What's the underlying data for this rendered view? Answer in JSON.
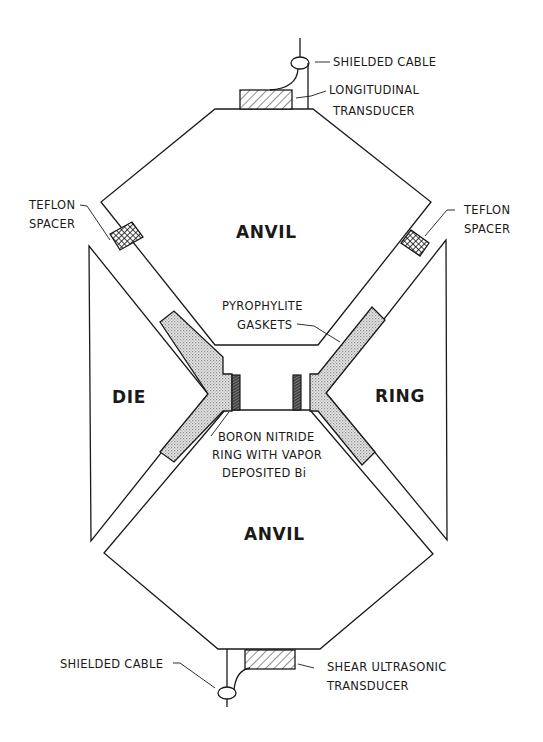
{
  "figure": {
    "type": "cross-section schematic"
  },
  "components": {
    "upper_anvil": {
      "label": "ANVIL"
    },
    "lower_anvil": {
      "label": "ANVIL"
    },
    "die": {
      "label": "DIE"
    },
    "ring": {
      "label": "RING"
    }
  },
  "callouts": {
    "top_cable": "SHIELDED CABLE",
    "longitudinal_transducer_line1": "LONGITUDINAL",
    "longitudinal_transducer_line2": "TRANSDUCER",
    "teflon_left_line1": "TEFLON",
    "teflon_left_line2": "SPACER",
    "teflon_right_line1": "TEFLON",
    "teflon_right_line2": "SPACER",
    "gaskets_line1": "PYROPHYLITE",
    "gaskets_line2": "GASKETS",
    "bn_line1": "BORON NITRIDE",
    "bn_line2": "RING WITH VAPOR",
    "bn_line3": "DEPOSITED Bi",
    "bottom_cable": "SHIELDED CABLE",
    "shear_transducer_line1": "SHEAR ULTRASONIC",
    "shear_transducer_line2": "TRANSDUCER"
  },
  "colors": {
    "ink": "#1a1a1a",
    "background": "#ffffff",
    "gasket_fill": "#d8d8d8"
  }
}
